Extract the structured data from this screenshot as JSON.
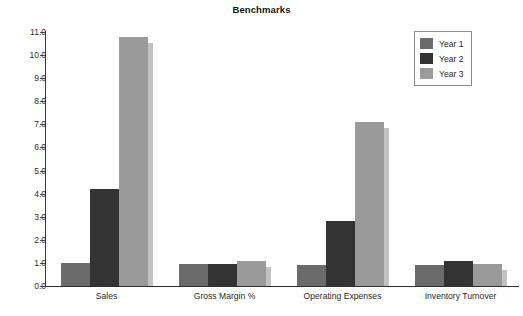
{
  "chart_data": {
    "type": "bar",
    "title": "Benchmarks",
    "xlabel": "",
    "ylabel": "",
    "ylim": [
      0.0,
      11.0
    ],
    "ytick_step": 1.0,
    "ytick_labels": [
      "0.0",
      "1.0",
      "2.0",
      "3.0",
      "4.0",
      "5.0",
      "6.0",
      "7.0",
      "8.0",
      "9.0",
      "10.0",
      "11.0"
    ],
    "ytick_values": [
      0.0,
      1.0,
      2.0,
      3.0,
      4.0,
      5.0,
      6.0,
      7.0,
      8.0,
      9.0,
      10.0,
      11.0
    ],
    "grid": false,
    "legend_position": "top-right",
    "categories": [
      "Sales",
      "Gross Margin %",
      "Operating Expenses",
      "Inventory Turnover"
    ],
    "series": [
      {
        "name": "Year 1",
        "color": "#6b6b6b",
        "values": [
          0.98,
          0.95,
          0.93,
          0.9
        ]
      },
      {
        "name": "Year 2",
        "color": "#333333",
        "values": [
          4.18,
          0.95,
          2.82,
          1.08
        ]
      },
      {
        "name": "Year 3",
        "color": "#9a9a9a",
        "values": [
          10.8,
          1.08,
          7.1,
          0.97
        ]
      }
    ]
  },
  "legend": {
    "entries": [
      {
        "label": "Year 1",
        "color": "#6b6b6b"
      },
      {
        "label": "Year 2",
        "color": "#333333"
      },
      {
        "label": "Year 3",
        "color": "#9a9a9a"
      }
    ]
  },
  "colors": {
    "background": "#ffffff",
    "axis": "#2d2d2d",
    "text": "#1f1f1f",
    "shadow": "#c2c2c2",
    "legend_border": "#8c8c8c"
  }
}
